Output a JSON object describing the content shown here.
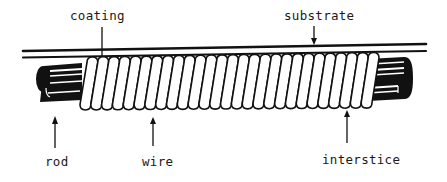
{
  "figure": {
    "type": "schematic cross-section",
    "labels": {
      "coating": "coating",
      "substrate": "substrate",
      "rod": "rod",
      "wire": "wire",
      "interstice": "interstice"
    },
    "colors": {
      "ink": "#111111",
      "background": "#ffffff"
    },
    "coil_turns": 27
  }
}
